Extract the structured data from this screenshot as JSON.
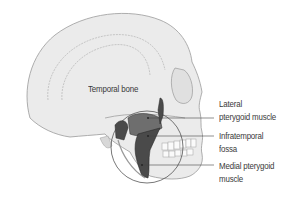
{
  "figure": {
    "colors": {
      "bone": "#ebebeb",
      "bone_outline": "#9a9a9a",
      "muscle_dark": "#4a4a4a",
      "muscle_mid": "#6e6e6e",
      "leader_line": "#444444",
      "text": "#3a3a3a"
    }
  },
  "labels": {
    "temporal_bone": "Temporal bone",
    "lateral_pterygoid_line1": "Lateral",
    "lateral_pterygoid_line2": "pterygoid muscle",
    "infratemporal_line1": "Infratemporal",
    "infratemporal_line2": "fossa",
    "medial_pterygoid_line1": "Medial pterygoid",
    "medial_pterygoid_line2": "muscle"
  }
}
